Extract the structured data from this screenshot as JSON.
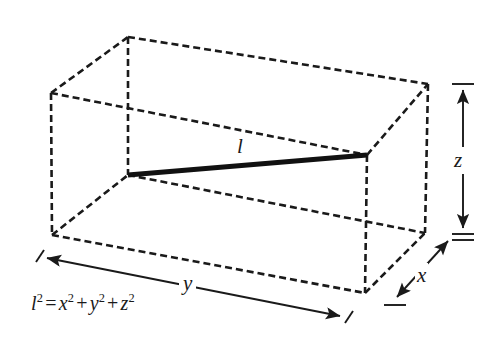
{
  "figure": {
    "background_color": "#ffffff",
    "line_color": "#1a1a1a",
    "diagonal_color": "#111111",
    "labels": {
      "diagonal": "l",
      "height": "z",
      "depth": "x",
      "width": "y"
    },
    "formula": {
      "lhs_var": "l",
      "lhs_exp": "2",
      "equals": "=",
      "term1_var": "x",
      "term1_exp": "2",
      "plus1": "+",
      "term2_var": "y",
      "term2_exp": "2",
      "plus2": "+",
      "term3_var": "z",
      "term3_exp": "2",
      "plain": "l2 = x2 + y2 + z2"
    },
    "geometry": {
      "description": "Dashed wireframe rectangular prism drawn in oblique projection with a solid heavy line marking the space diagonal l from the back-bottom-left inner vertex to the front-top-right vertex.",
      "vertices": {
        "front_top_left": [
          51,
          93
        ],
        "front_top_right": [
          367,
          155
        ],
        "front_bottom_left": [
          52,
          235
        ],
        "front_bottom_right": [
          365,
          293
        ],
        "back_top_left": [
          128,
          37
        ],
        "back_top_right": [
          428,
          84
        ],
        "back_bottom_left": [
          128,
          175
        ],
        "back_bottom_right": [
          425,
          233
        ]
      },
      "diagonal_endpoints": [
        [
          128,
          175
        ],
        [
          367,
          155
        ]
      ],
      "dash_pattern": "7 4",
      "stroke_width": 2.6,
      "diagonal_stroke_width": 5
    },
    "dimension_lines": {
      "width_y": {
        "from": [
          47,
          258
        ],
        "to": [
          340,
          316
        ],
        "label": "y",
        "style": "double-arrow-with-end-ticks"
      },
      "height_z": {
        "from": [
          463,
          90
        ],
        "to": [
          463,
          228
        ],
        "label": "z",
        "style": "double-arrow-with-end-ticks"
      },
      "depth_x": {
        "from": [
          448,
          241
        ],
        "to": [
          397,
          297
        ],
        "label": "x",
        "style": "double-arrow-with-end-ticks"
      }
    }
  }
}
